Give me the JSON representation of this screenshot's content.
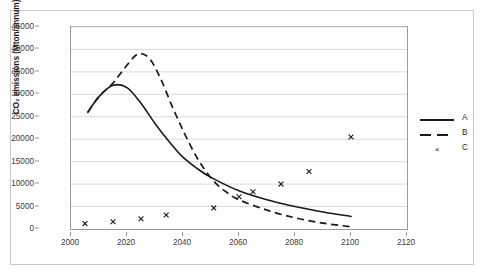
{
  "chart_data": {
    "type": "line",
    "title": "",
    "xlabel": "",
    "ylabel": "CO₂ emissions (Mton/annum)",
    "xlim": [
      2000,
      2120
    ],
    "ylim": [
      0,
      45000
    ],
    "xticks": [
      "2000",
      "2020",
      "2040",
      "2060",
      "2080",
      "2100",
      "2120"
    ],
    "yticks": [
      "0",
      "5000",
      "10000",
      "15000",
      "20000",
      "25000",
      "30000",
      "35000",
      "40000",
      "45000"
    ],
    "grid": "horizontal",
    "legend_position": "right",
    "series": [
      {
        "name": "A",
        "style": "solid-line",
        "x": [
          2006,
          2010,
          2015,
          2020,
          2025,
          2030,
          2035,
          2040,
          2045,
          2050,
          2060,
          2070,
          2080,
          2090,
          2100
        ],
        "values": [
          26000,
          29500,
          32000,
          31500,
          28000,
          23500,
          19500,
          16000,
          13500,
          11500,
          8500,
          6500,
          5000,
          3800,
          2800
        ]
      },
      {
        "name": "B",
        "style": "dashed-line",
        "x": [
          2006,
          2010,
          2015,
          2020,
          2024,
          2028,
          2032,
          2036,
          2040,
          2044,
          2048,
          2052,
          2056,
          2060,
          2070,
          2080,
          2090,
          2100
        ],
        "values": [
          26000,
          29500,
          32500,
          36500,
          39000,
          38000,
          33500,
          27500,
          22000,
          17000,
          13000,
          10000,
          8000,
          6500,
          4200,
          2500,
          1300,
          500
        ]
      },
      {
        "name": "C",
        "style": "x-markers",
        "x": [
          2005,
          2015,
          2025,
          2034,
          2051,
          2060,
          2065,
          2075,
          2085,
          2100
        ],
        "values": [
          1200,
          1600,
          2300,
          3100,
          4700,
          7200,
          8300,
          10000,
          12800,
          20500
        ]
      }
    ],
    "legend": [
      {
        "label": "A",
        "style": "solid-line"
      },
      {
        "label": "B",
        "style": "dashed-line"
      },
      {
        "label": "C",
        "style": "x-markers"
      }
    ],
    "colors": {
      "line": "#1a1a1a",
      "grid": "#d9d9d9",
      "axis": "#9a9a9a",
      "text": "#3a3a3a"
    }
  }
}
